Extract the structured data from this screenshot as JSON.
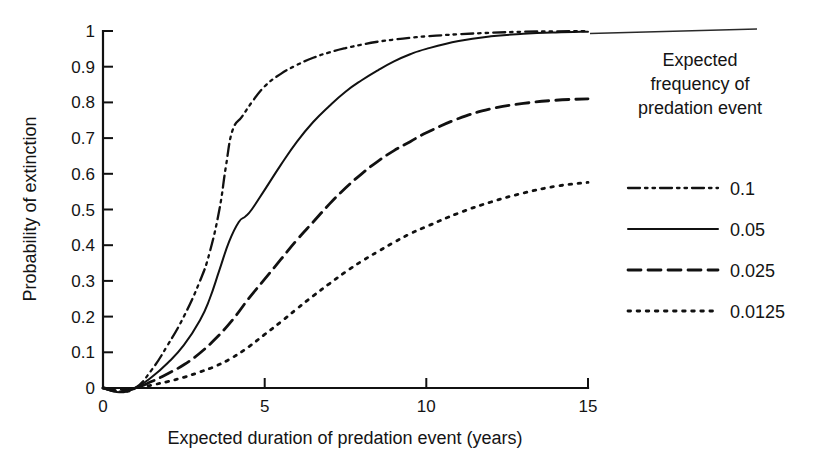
{
  "chart_data": {
    "type": "line",
    "title": "",
    "xlabel": "Expected duration of predation event (years)",
    "ylabel": "Probability of extinction",
    "xlim": [
      0,
      15
    ],
    "ylim": [
      0,
      1
    ],
    "xticks": [
      "0",
      "5",
      "10",
      "15"
    ],
    "xtick_values": [
      0,
      5,
      10,
      15
    ],
    "yticks": [
      "0",
      "0.1",
      "0.2",
      "0.3",
      "0.4",
      "0.5",
      "0.6",
      "0.7",
      "0.8",
      "0.9",
      "1"
    ],
    "ytick_values": [
      0,
      0.1,
      0.2,
      0.3,
      0.4,
      0.5,
      0.6,
      0.7,
      0.8,
      0.9,
      1.0
    ],
    "grid": false,
    "legend_position": "right",
    "legend_title": "Expected frequency of predation event",
    "legend_title_lines": [
      "Expected",
      "frequency of",
      "predation event"
    ],
    "series": [
      {
        "name": "0.1",
        "style": "dash-dot-dot",
        "x": [
          0,
          0.5,
          1.0,
          1.5,
          2.0,
          2.5,
          3.0,
          3.3,
          3.6,
          3.8,
          4.0,
          4.3,
          4.6,
          5.0,
          5.5,
          6.0,
          6.5,
          7.0,
          7.5,
          8.0,
          8.5,
          9.0,
          9.5,
          10.0,
          11.0,
          12.0,
          13.0,
          14.0,
          15.0
        ],
        "y": [
          0.0,
          -0.01,
          0.0,
          0.05,
          0.12,
          0.2,
          0.3,
          0.38,
          0.5,
          0.62,
          0.72,
          0.76,
          0.8,
          0.845,
          0.88,
          0.905,
          0.925,
          0.94,
          0.952,
          0.962,
          0.97,
          0.976,
          0.981,
          0.985,
          0.991,
          0.995,
          0.998,
          0.999,
          1.0
        ]
      },
      {
        "name": "0.05",
        "style": "solid",
        "x": [
          0,
          0.5,
          1.0,
          1.5,
          2.0,
          2.5,
          3.0,
          3.3,
          3.6,
          3.9,
          4.2,
          4.4,
          4.6,
          5.0,
          5.5,
          6.0,
          6.5,
          7.0,
          7.5,
          8.0,
          8.5,
          9.0,
          9.5,
          10.0,
          11.0,
          12.0,
          13.0,
          14.0,
          15.0
        ],
        "y": [
          0.0,
          -0.012,
          0.0,
          0.03,
          0.07,
          0.12,
          0.19,
          0.25,
          0.33,
          0.41,
          0.465,
          0.48,
          0.5,
          0.555,
          0.625,
          0.69,
          0.745,
          0.79,
          0.83,
          0.862,
          0.89,
          0.915,
          0.935,
          0.95,
          0.972,
          0.985,
          0.992,
          0.996,
          0.998
        ]
      },
      {
        "name": "0.025",
        "style": "dashed",
        "x": [
          0,
          0.5,
          1.0,
          1.5,
          2.0,
          2.5,
          3.0,
          3.5,
          4.0,
          4.5,
          5.0,
          5.5,
          6.0,
          6.5,
          7.0,
          7.5,
          8.0,
          8.5,
          9.0,
          9.5,
          10.0,
          11.0,
          12.0,
          13.0,
          14.0,
          15.0
        ],
        "y": [
          0.0,
          -0.008,
          0.0,
          0.018,
          0.04,
          0.065,
          0.098,
          0.14,
          0.19,
          0.25,
          0.305,
          0.36,
          0.415,
          0.465,
          0.515,
          0.56,
          0.6,
          0.635,
          0.665,
          0.69,
          0.715,
          0.755,
          0.782,
          0.797,
          0.806,
          0.81
        ]
      },
      {
        "name": "0.0125",
        "style": "dotted",
        "x": [
          0,
          0.5,
          1.0,
          1.5,
          2.0,
          2.5,
          3.0,
          3.5,
          4.0,
          4.5,
          5.0,
          5.5,
          6.0,
          6.5,
          7.0,
          7.5,
          8.0,
          8.5,
          9.0,
          9.5,
          10.0,
          11.0,
          12.0,
          13.0,
          14.0,
          15.0
        ],
        "y": [
          0.0,
          -0.004,
          0.0,
          0.008,
          0.018,
          0.03,
          0.045,
          0.062,
          0.085,
          0.115,
          0.15,
          0.185,
          0.222,
          0.258,
          0.292,
          0.325,
          0.355,
          0.382,
          0.408,
          0.432,
          0.452,
          0.49,
          0.521,
          0.546,
          0.565,
          0.576
        ]
      }
    ]
  },
  "legend": {
    "title_lines": [
      "Expected",
      "frequency of",
      "predation event"
    ],
    "entries": [
      {
        "label": "0.1",
        "style": "dash-dot-dot"
      },
      {
        "label": "0.05",
        "style": "solid"
      },
      {
        "label": "0.025",
        "style": "dashed"
      },
      {
        "label": "0.0125",
        "style": "dotted"
      }
    ]
  },
  "axes": {
    "x_title": "Expected duration of predation event (years)",
    "y_title": "Probability of extinction",
    "x_tick_labels": [
      "0",
      "5",
      "10",
      "15"
    ],
    "y_tick_labels": [
      "0",
      "0.1",
      "0.2",
      "0.3",
      "0.4",
      "0.5",
      "0.6",
      "0.7",
      "0.8",
      "0.9",
      "1"
    ]
  },
  "colors": {
    "ink": "#111111",
    "background": "#ffffff"
  }
}
